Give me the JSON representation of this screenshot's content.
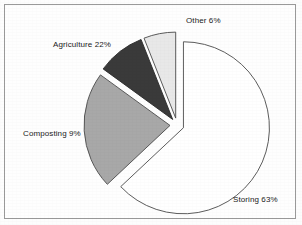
{
  "chart_data": {
    "type": "pie",
    "title": "",
    "subtitle": "",
    "xlabel": "",
    "ylabel": "",
    "legend_position": "none",
    "grid": false,
    "exploded": true,
    "start_angle_deg": 0,
    "direction": "clockwise",
    "categories": [
      "Storing",
      "Agriculture",
      "Composting",
      "Other"
    ],
    "values": [
      63,
      22,
      9,
      6
    ],
    "unit": "%",
    "slices": [
      {
        "name": "Storing",
        "value": 63,
        "label": "Storing 63%",
        "color": "#ffffff",
        "stroke": "#4a4a4a"
      },
      {
        "name": "Agriculture",
        "value": 22,
        "label": "Agriculture 22%",
        "color": "#a8a8a8",
        "stroke": "#4a4a4a"
      },
      {
        "name": "Composting",
        "value": 9,
        "label": "Composting 9%",
        "color": "#3a3a3a",
        "stroke": "#2a2a2a"
      },
      {
        "name": "Other",
        "value": 6,
        "label": "Other 6%",
        "color": "#e8e8e8",
        "stroke": "#4a4a4a"
      }
    ],
    "annotations": []
  },
  "frame": {
    "border_color": "#9a9a9a",
    "background": "#fefefe"
  }
}
